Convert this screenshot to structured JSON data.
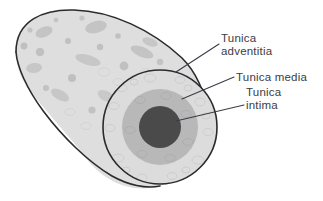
{
  "figure": {
    "background_color": "#ffffff",
    "outline_color": "#2b2b2b"
  },
  "labels": [
    {
      "id": "tunica-adventitia",
      "line1": "Tunica",
      "line2": "adventitia",
      "text": "Tunica adventitia",
      "color": "#3c3c46",
      "leader_from": [
        219,
        44
      ],
      "leader_to": [
        176,
        72
      ]
    },
    {
      "id": "tunica-media",
      "line1": "Tunica media",
      "line2": "",
      "text": "Tunica media",
      "color": "#3c3c46",
      "leader_from": [
        234,
        77
      ],
      "leader_to": [
        182,
        99
      ]
    },
    {
      "id": "tunica-intima",
      "line1": "Tunica",
      "line2": "intima",
      "text": "Tunica intima",
      "color": "#3c3c46",
      "leader_from": [
        244,
        105
      ],
      "leader_to": [
        176,
        121
      ]
    }
  ],
  "anatomy": {
    "vessel_body": {
      "name": "vessel-tube",
      "fill_color": "#dedede",
      "speckle_color": "#b4b4b4"
    },
    "cross_section": {
      "center": [
        160,
        127
      ],
      "layers": [
        {
          "name": "tunica-adventitia",
          "radius": 57,
          "fill_color": "#dcdcdc"
        },
        {
          "name": "tunica-media",
          "radius": 38,
          "fill_color": "#b8b8b8"
        },
        {
          "name": "tunica-intima-lumen",
          "radius": 21,
          "fill_color": "#4a4a4a"
        }
      ]
    }
  }
}
